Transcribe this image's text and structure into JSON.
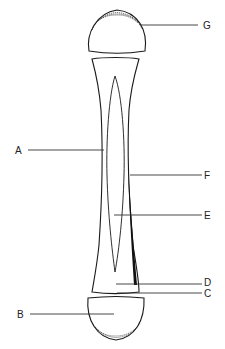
{
  "diagram": {
    "labels": {
      "A": "A",
      "B": "B",
      "C": "C",
      "D": "D",
      "E": "E",
      "F": "F",
      "G": "G"
    },
    "colors": {
      "line": "#1a1a1a",
      "background": "#ffffff",
      "fill": "#ffffff"
    }
  }
}
